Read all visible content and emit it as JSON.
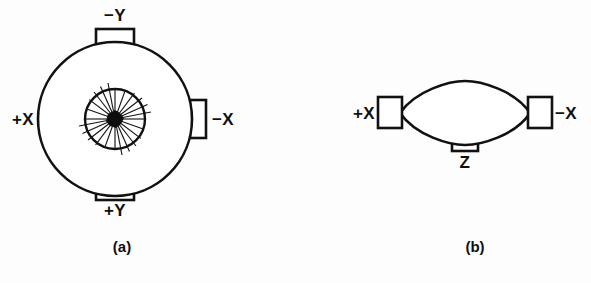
{
  "figure": {
    "background_color": "#fdfdfd",
    "line_color": "#111111",
    "fill_color": "#ffffff",
    "hub_color": "#0d0d0d",
    "width": 591,
    "height": 283
  },
  "panels": [
    {
      "id": "panel-a",
      "caption": "(a)",
      "caption_x": 122,
      "caption_y": 252,
      "view": "axial-view",
      "body": {
        "shape": "circle",
        "center_x": 115,
        "center_y": 119,
        "radius": 77
      },
      "inner_hub": {
        "shape": "spoked-wheel",
        "center_x": 115,
        "center_y": 119,
        "radius": 30,
        "spoke_count": 18,
        "hub_radius": 6
      },
      "ports": [
        {
          "name": "port-minus-y",
          "label": "−Y",
          "side": "top",
          "rect_x": 96,
          "rect_y": 29,
          "rect_w": 38,
          "rect_h": 16,
          "label_x": 115,
          "label_y": 21
        },
        {
          "name": "port-plus-x",
          "label": "+X",
          "side": "left",
          "rect_x": 41,
          "rect_y": 100,
          "rect_w": 16,
          "rect_h": 38,
          "label_x": 32,
          "label_y": 125
        },
        {
          "name": "port-minus-x",
          "label": "−X",
          "side": "right",
          "rect_x": 190,
          "rect_y": 100,
          "rect_w": 16,
          "rect_h": 38,
          "label_x": 214,
          "label_y": 125
        },
        {
          "name": "port-plus-y",
          "label": "+Y",
          "side": "bottom",
          "rect_x": 96,
          "rect_y": 184,
          "rect_w": 38,
          "rect_h": 16,
          "label_x": 115,
          "label_y": 216
        }
      ]
    },
    {
      "id": "panel-b",
      "caption": "(b)",
      "caption_x": 475,
      "caption_y": 252,
      "view": "side-view",
      "body": {
        "shape": "lens",
        "left_x": 399,
        "right_x": 531,
        "center_y": 113,
        "top_y": 88,
        "bottom_y": 139
      },
      "ports": [
        {
          "name": "port-plus-x",
          "label": "+X",
          "side": "left",
          "rect_x": 378,
          "rect_y": 97,
          "rect_w": 24,
          "rect_h": 31,
          "label_x": 369,
          "label_y": 118
        },
        {
          "name": "port-minus-x",
          "label": "−X",
          "side": "right",
          "rect_x": 528,
          "rect_y": 97,
          "rect_w": 24,
          "rect_h": 31,
          "label_x": 559,
          "label_y": 118
        },
        {
          "name": "port-z",
          "label": "Z",
          "side": "bottom",
          "rect_x": 452,
          "rect_y": 137,
          "rect_w": 26,
          "rect_h": 14,
          "label_x": 465,
          "label_y": 167
        }
      ]
    }
  ]
}
